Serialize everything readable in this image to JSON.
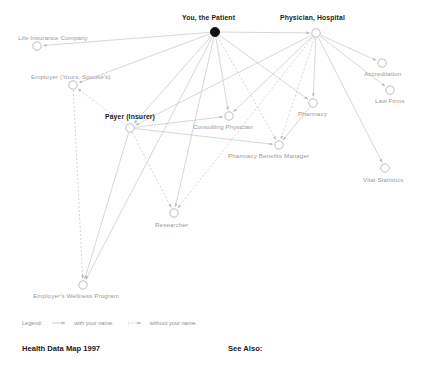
{
  "diagram": {
    "title": "Health Data Map 1997",
    "see_also_label": "See Also:",
    "edge_color": "#c9c9c9",
    "node_stroke": "#b0b0b0",
    "patient_fill": "#111111",
    "nodes": [
      {
        "id": "patient",
        "label": "You, the Patient",
        "x": 215,
        "y": 32,
        "label_x": 182,
        "label_y": 15,
        "emphasis": true,
        "filled": true
      },
      {
        "id": "physician",
        "label": "Physician, Hospital",
        "x": 316,
        "y": 33,
        "label_x": 280,
        "label_y": 15,
        "emphasis": true,
        "filled": false
      },
      {
        "id": "life-insurance",
        "label": "Life Insurance Company",
        "x": 37,
        "y": 46,
        "label_x": 18,
        "label_y": 35,
        "emphasis": false,
        "filled": false
      },
      {
        "id": "employer",
        "label": "Employer (Yours, Spouse's)",
        "x": 73,
        "y": 85,
        "label_x": 31,
        "label_y": 74,
        "emphasis": false,
        "filled": false
      },
      {
        "id": "payer",
        "label": "Payer (Insurer)",
        "x": 130,
        "y": 128,
        "label_x": 105,
        "label_y": 114,
        "emphasis": true,
        "filled": false
      },
      {
        "id": "consulting",
        "label": "Consulting Physician",
        "x": 229,
        "y": 116,
        "label_x": 193,
        "label_y": 124,
        "emphasis": false,
        "filled": false
      },
      {
        "id": "pharmacy",
        "label": "Pharmacy",
        "x": 313,
        "y": 103,
        "label_x": 298,
        "label_y": 111,
        "emphasis": false,
        "filled": false
      },
      {
        "id": "pbm",
        "label": "Pharmacy Benefits Manager",
        "x": 279,
        "y": 145,
        "label_x": 228,
        "label_y": 153,
        "emphasis": false,
        "filled": false
      },
      {
        "id": "accreditation",
        "label": "Accreditation",
        "x": 382,
        "y": 63,
        "label_x": 364,
        "label_y": 71,
        "emphasis": false,
        "filled": false
      },
      {
        "id": "law-firms",
        "label": "Law Firms",
        "x": 390,
        "y": 90,
        "label_x": 375,
        "label_y": 98,
        "emphasis": false,
        "filled": false
      },
      {
        "id": "vital-statistics",
        "label": "Vital Statistics",
        "x": 385,
        "y": 168,
        "label_x": 363,
        "label_y": 177,
        "emphasis": false,
        "filled": false
      },
      {
        "id": "researcher",
        "label": "Researcher",
        "x": 174,
        "y": 213,
        "label_x": 155,
        "label_y": 222,
        "emphasis": false,
        "filled": false
      },
      {
        "id": "wellness",
        "label": "Employer's Wellness Program",
        "x": 83,
        "y": 285,
        "label_x": 33,
        "label_y": 293,
        "emphasis": false,
        "filled": false
      }
    ],
    "edges": [
      {
        "from": "patient",
        "to": "life-insurance",
        "style": "solid"
      },
      {
        "from": "patient",
        "to": "employer",
        "style": "solid"
      },
      {
        "from": "patient",
        "to": "payer",
        "style": "solid"
      },
      {
        "from": "patient",
        "to": "physician",
        "style": "solid"
      },
      {
        "from": "patient",
        "to": "consulting",
        "style": "solid"
      },
      {
        "from": "patient",
        "to": "pharmacy",
        "style": "solid"
      },
      {
        "from": "patient",
        "to": "pbm",
        "style": "dashed"
      },
      {
        "from": "patient",
        "to": "researcher",
        "style": "solid"
      },
      {
        "from": "patient",
        "to": "wellness",
        "style": "solid"
      },
      {
        "from": "physician",
        "to": "payer",
        "style": "solid"
      },
      {
        "from": "physician",
        "to": "consulting",
        "style": "solid"
      },
      {
        "from": "physician",
        "to": "pharmacy",
        "style": "solid"
      },
      {
        "from": "physician",
        "to": "accreditation",
        "style": "solid"
      },
      {
        "from": "physician",
        "to": "law-firms",
        "style": "solid"
      },
      {
        "from": "physician",
        "to": "vital-statistics",
        "style": "solid"
      },
      {
        "from": "physician",
        "to": "researcher",
        "style": "dashed"
      },
      {
        "from": "physician",
        "to": "pbm",
        "style": "dashed"
      },
      {
        "from": "payer",
        "to": "employer",
        "style": "dashed"
      },
      {
        "from": "payer",
        "to": "consulting",
        "style": "solid"
      },
      {
        "from": "payer",
        "to": "pbm",
        "style": "solid"
      },
      {
        "from": "payer",
        "to": "researcher",
        "style": "dashed"
      },
      {
        "from": "payer",
        "to": "wellness",
        "style": "solid"
      },
      {
        "from": "employer",
        "to": "wellness",
        "style": "dashed"
      },
      {
        "from": "pharmacy",
        "to": "pbm",
        "style": "solid"
      }
    ]
  },
  "legend": {
    "label": "Legend:",
    "solid_text": "with your name.",
    "dashed_text": "without your name."
  }
}
